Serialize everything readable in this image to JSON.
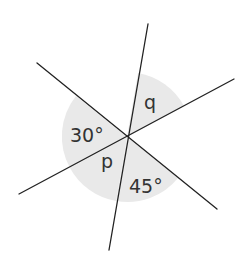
{
  "diagram": {
    "colors": {
      "line": "#222222",
      "shade": "#e8e8e8",
      "text": "#333333"
    },
    "labels": {
      "angle_left": "30°",
      "angle_top": "q",
      "angle_lower_left": "p",
      "angle_lower": "45°"
    }
  }
}
